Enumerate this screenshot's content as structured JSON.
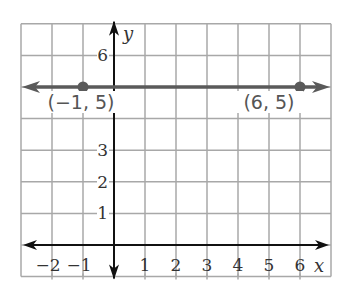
{
  "chart_data": {
    "type": "line",
    "title": "",
    "xlabel": "x",
    "ylabel": "y",
    "xlim": [
      -3,
      7
    ],
    "ylim": [
      0,
      7
    ],
    "grid": true,
    "x_ticks": [
      "−2",
      "−1",
      "1",
      "2",
      "3",
      "4",
      "5",
      "6"
    ],
    "y_ticks": [
      "1",
      "2",
      "3",
      "6"
    ],
    "series": [
      {
        "name": "y = 5",
        "description": "Horizontal line through two points, extending both directions (arrows)",
        "points": [
          {
            "x": -1,
            "y": 5,
            "label": "(−1, 5)"
          },
          {
            "x": 6,
            "y": 5,
            "label": "(6, 5)"
          }
        ],
        "color": "#5a5a5a"
      }
    ],
    "annotations": [
      "(−1, 5)",
      "(6, 5)"
    ]
  },
  "colors": {
    "grid": "#a8a8a8",
    "axis": "#111111",
    "line": "#5a5a5a"
  }
}
